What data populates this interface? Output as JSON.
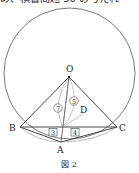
{
  "header_text_fragment": "め、横書問題 50 の与えれ",
  "figure": {
    "caption": "図 2",
    "points": {
      "O": "O",
      "A": "A",
      "B": "B",
      "C": "C",
      "D": "D"
    },
    "circled_labels": [
      "⑦",
      "⑤"
    ],
    "boxed_labels": [
      "3",
      "4"
    ]
  }
}
